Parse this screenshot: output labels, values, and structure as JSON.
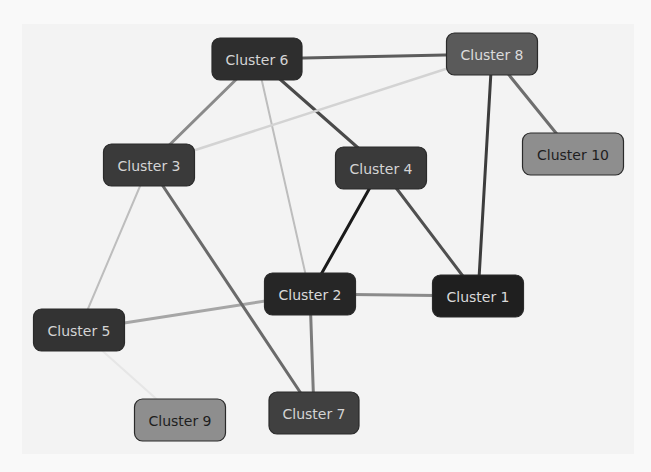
{
  "diagram": {
    "type": "network-graph",
    "background": "#f3f3f3",
    "nodes": [
      {
        "id": "c1",
        "label": "Cluster 1",
        "cx": 478,
        "cy": 296,
        "w": 91,
        "h": 42,
        "fill": "#1f1f1f",
        "text": "#d9d9d9"
      },
      {
        "id": "c2",
        "label": "Cluster 2",
        "cx": 310,
        "cy": 294,
        "w": 91,
        "h": 42,
        "fill": "#262626",
        "text": "#d9d9d9"
      },
      {
        "id": "c3",
        "label": "Cluster 3",
        "cx": 149,
        "cy": 165,
        "w": 91,
        "h": 42,
        "fill": "#3a3a3a",
        "text": "#d4d4d4"
      },
      {
        "id": "c4",
        "label": "Cluster 4",
        "cx": 381,
        "cy": 168,
        "w": 91,
        "h": 42,
        "fill": "#3a3a3a",
        "text": "#d4d4d4"
      },
      {
        "id": "c5",
        "label": "Cluster 5",
        "cx": 79,
        "cy": 330,
        "w": 91,
        "h": 42,
        "fill": "#333333",
        "text": "#d4d4d4"
      },
      {
        "id": "c6",
        "label": "Cluster 6",
        "cx": 257,
        "cy": 59,
        "w": 90,
        "h": 42,
        "fill": "#2e2e2e",
        "text": "#d4d4d4"
      },
      {
        "id": "c7",
        "label": "Cluster 7",
        "cx": 314,
        "cy": 413,
        "w": 90,
        "h": 42,
        "fill": "#404040",
        "text": "#d4d4d4"
      },
      {
        "id": "c8",
        "label": "Cluster 8",
        "cx": 492,
        "cy": 54,
        "w": 91,
        "h": 42,
        "fill": "#5a5a5a",
        "text": "#dcdcdc"
      },
      {
        "id": "c9",
        "label": "Cluster 9",
        "cx": 180,
        "cy": 420,
        "w": 91,
        "h": 42,
        "fill": "#8e8e8e",
        "text": "#1e1e1e"
      },
      {
        "id": "c10",
        "label": "Cluster 10",
        "cx": 573,
        "cy": 154,
        "w": 101,
        "h": 42,
        "fill": "#8e8e8e",
        "text": "#1e1e1e"
      }
    ],
    "edges": [
      {
        "from": "c6",
        "to": "c8",
        "color": "#5c5c5c",
        "width": 3
      },
      {
        "from": "c6",
        "to": "c3",
        "color": "#8a8a8a",
        "width": 3
      },
      {
        "from": "c6",
        "to": "c4",
        "color": "#4a4a4a",
        "width": 3
      },
      {
        "from": "c6",
        "to": "c2",
        "color": "#bdbdbd",
        "width": 2
      },
      {
        "from": "c8",
        "to": "c3",
        "color": "#d3d3d3",
        "width": 2.5
      },
      {
        "from": "c8",
        "to": "c1",
        "color": "#3c3c3c",
        "width": 3
      },
      {
        "from": "c8",
        "to": "c10",
        "color": "#6e6e6e",
        "width": 3
      },
      {
        "from": "c4",
        "to": "c2",
        "color": "#1a1a1a",
        "width": 3
      },
      {
        "from": "c4",
        "to": "c1",
        "color": "#505050",
        "width": 3
      },
      {
        "from": "c2",
        "to": "c1",
        "color": "#8a8a8a",
        "width": 3
      },
      {
        "from": "c2",
        "to": "c5",
        "color": "#a6a6a6",
        "width": 3
      },
      {
        "from": "c2",
        "to": "c7",
        "color": "#7c7c7c",
        "width": 3
      },
      {
        "from": "c3",
        "to": "c5",
        "color": "#bdbdbd",
        "width": 2
      },
      {
        "from": "c3",
        "to": "c7",
        "color": "#6a6a6a",
        "width": 3
      },
      {
        "from": "c5",
        "to": "c9",
        "color": "#e6e6e6",
        "width": 2
      }
    ]
  }
}
